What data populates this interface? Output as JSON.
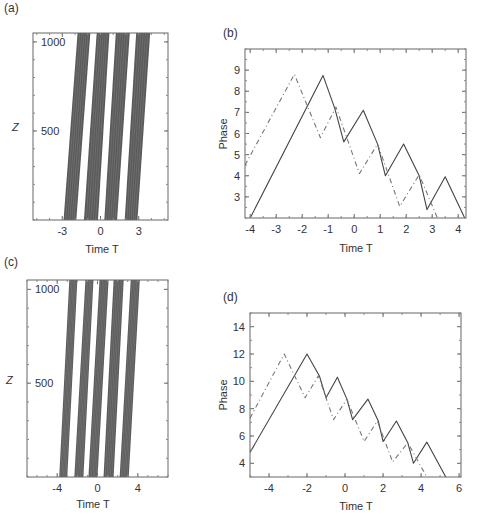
{
  "panels": {
    "a": {
      "label": "(a)",
      "xlabel": "Time T",
      "ylabel": "Z",
      "xticks": [
        "-3",
        "0",
        "3"
      ],
      "yticks": [
        "500",
        "1000"
      ]
    },
    "b": {
      "label": "(b)",
      "xlabel": "Time T",
      "ylabel": "Phase",
      "xticks": [
        "-4",
        "-3",
        "-2",
        "-1",
        "0",
        "1",
        "2",
        "3",
        "4"
      ],
      "yticks": [
        "3",
        "4",
        "5",
        "6",
        "7",
        "8",
        "9"
      ]
    },
    "c": {
      "label": "(c)",
      "xlabel": "Time T",
      "ylabel": "Z",
      "xticks": [
        "-4",
        "0",
        "4"
      ],
      "yticks": [
        "500",
        "1000"
      ]
    },
    "d": {
      "label": "(d)",
      "xlabel": "Time T",
      "ylabel": "Phase",
      "xticks": [
        "-4",
        "-2",
        "0",
        "2",
        "4",
        "6"
      ],
      "yticks": [
        "4",
        "6",
        "8",
        "10",
        "12",
        "14"
      ]
    }
  },
  "chart_data": [
    {
      "panel": "a",
      "type": "heatmap",
      "title": "",
      "xlabel": "Time T",
      "ylabel": "Z",
      "xlim": [
        -5.3,
        5.3
      ],
      "ylim": [
        0,
        1050
      ],
      "xticks": [
        -3,
        0,
        3
      ],
      "yticks": [
        500,
        1000
      ],
      "description": "Four tilted dense bands of trajectories drifting right with increasing Z",
      "bands": [
        {
          "t_start_z0": [
            -2.9,
            -1.9
          ],
          "t_end_z1050": [
            -1.8,
            -0.8
          ]
        },
        {
          "t_start_z0": [
            -1.3,
            -0.2
          ],
          "t_end_z1050": [
            -0.3,
            0.7
          ]
        },
        {
          "t_start_z0": [
            0.3,
            1.3
          ],
          "t_end_z1050": [
            1.2,
            2.3
          ]
        },
        {
          "t_start_z0": [
            1.9,
            2.9
          ],
          "t_end_z1050": [
            2.8,
            3.9
          ]
        }
      ]
    },
    {
      "panel": "b",
      "type": "line",
      "title": "",
      "xlabel": "Time T",
      "ylabel": "Phase",
      "xlim": [
        -4.2,
        4.3
      ],
      "ylim": [
        2,
        10
      ],
      "grid": false,
      "series": [
        {
          "name": "solid",
          "style": "solid",
          "x": [
            -4.0,
            -1.2,
            -0.75,
            -0.4,
            0.35,
            0.9,
            1.2,
            1.9,
            2.5,
            2.8,
            3.5,
            4.25
          ],
          "y": [
            2.0,
            8.75,
            7.2,
            5.6,
            7.1,
            5.5,
            4.0,
            5.5,
            4.0,
            2.4,
            3.95,
            2.0
          ]
        },
        {
          "name": "dashed",
          "style": "dashed",
          "x": [
            -4.2,
            -2.3,
            -1.3,
            -0.7,
            0.2,
            0.9,
            1.75,
            2.5,
            3.2
          ],
          "y": [
            4.5,
            8.8,
            5.8,
            7.25,
            4.1,
            5.5,
            2.55,
            4.05,
            2.0
          ]
        }
      ]
    },
    {
      "panel": "c",
      "type": "heatmap",
      "title": "",
      "xlabel": "Time T",
      "ylabel": "Z",
      "xlim": [
        -7,
        7
      ],
      "ylim": [
        0,
        1050
      ],
      "xticks": [
        -4,
        0,
        4
      ],
      "yticks": [
        500,
        1000
      ],
      "description": "Five tilted dense bands of trajectories drifting right with increasing Z",
      "bands": [
        {
          "t_start_z0": [
            -3.8,
            -3.0
          ],
          "t_end_z1050": [
            -2.8,
            -2.0
          ]
        },
        {
          "t_start_z0": [
            -2.3,
            -1.4
          ],
          "t_end_z1050": [
            -1.2,
            -0.4
          ]
        },
        {
          "t_start_z0": [
            -0.9,
            0.0
          ],
          "t_end_z1050": [
            0.2,
            1.1
          ]
        },
        {
          "t_start_z0": [
            0.6,
            1.6
          ],
          "t_end_z1050": [
            1.6,
            2.6
          ]
        },
        {
          "t_start_z0": [
            2.2,
            3.1
          ],
          "t_end_z1050": [
            3.3,
            4.2
          ]
        }
      ]
    },
    {
      "panel": "d",
      "type": "line",
      "title": "",
      "xlabel": "Time T",
      "ylabel": "Phase",
      "xlim": [
        -5,
        6.1
      ],
      "ylim": [
        3,
        15
      ],
      "grid": false,
      "series": [
        {
          "name": "solid",
          "style": "solid",
          "x": [
            -5.0,
            -2.0,
            -1.35,
            -1.0,
            -0.4,
            0.1,
            0.4,
            1.2,
            1.75,
            2.0,
            2.7,
            3.3,
            3.6,
            4.3,
            5.3
          ],
          "y": [
            4.8,
            12.0,
            10.4,
            8.8,
            10.3,
            8.7,
            7.2,
            8.7,
            7.1,
            5.6,
            7.1,
            5.5,
            4.0,
            5.55,
            3.0
          ]
        },
        {
          "name": "dashed",
          "style": "dashed",
          "x": [
            -5.0,
            -3.2,
            -2.1,
            -1.4,
            -0.6,
            0.1,
            1.0,
            1.7,
            2.5,
            3.3,
            4.3
          ],
          "y": [
            7.3,
            12.0,
            8.8,
            10.4,
            7.2,
            8.7,
            5.6,
            7.1,
            4.1,
            5.5,
            3.0
          ]
        }
      ]
    }
  ]
}
